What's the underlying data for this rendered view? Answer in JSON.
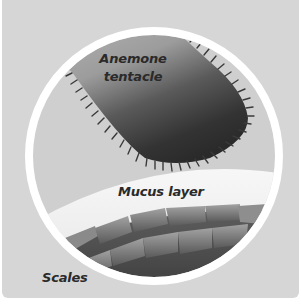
{
  "diagram": {
    "labels": {
      "tentacle_line1": "Anemone",
      "tentacle_line2": "tentacle",
      "mucus": "Mucus layer",
      "scales": "Scales"
    },
    "parts": [
      {
        "id": "tentacle",
        "description": "Spiky-edged anemone tentacle tip descending from upper left"
      },
      {
        "id": "mucus-layer",
        "description": "Pale curved layer covering the scales"
      },
      {
        "id": "scales",
        "description": "Overlapping rows of fish scales"
      },
      {
        "id": "magnifier-ring",
        "description": "White circular ring framing the close-up"
      }
    ],
    "colors": {
      "background": "#d6d6d6",
      "ring": "#ffffff",
      "tentacle_light": "#a8a8a8",
      "tentacle_dark": "#2e2e2e",
      "mucus": "#f2f2f2",
      "scales_light": "#9a9a9a",
      "scales_dark": "#4a4a4a",
      "text": "#2a2a2a"
    }
  }
}
